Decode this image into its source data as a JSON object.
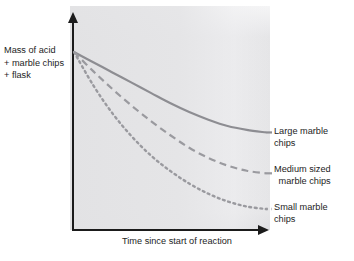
{
  "chart_data": {
    "type": "line",
    "title": "",
    "xlabel": "Time since start of reaction",
    "ylabel": "Mass of acid\n+ marble chips\n+ flask",
    "grid": false,
    "legend_position": "right-inline",
    "xlim": [
      0,
      100
    ],
    "ylim": [
      0,
      100
    ],
    "axis_ticks": {
      "x": [],
      "y": []
    },
    "x": [
      0,
      10,
      20,
      30,
      40,
      50,
      60,
      70,
      80,
      90,
      100
    ],
    "series": [
      {
        "name": "Large marble chips",
        "label": "Large marble\nchips",
        "style": "solid",
        "color": "#8d8d92",
        "values": [
          100,
          96,
          92,
          88,
          84,
          80,
          76.5,
          73.5,
          71,
          69.5,
          68.5
        ]
      },
      {
        "name": "Medium sized marble chips",
        "label": "Medium sized\nmarble chips",
        "style": "dashed",
        "color": "#9a9a9f",
        "values": [
          100,
          92.5,
          85.5,
          79,
          73,
          67.5,
          62.5,
          58.5,
          55.5,
          53.5,
          52.5
        ]
      },
      {
        "name": "Small marble chips",
        "label": "Small marble\nchips",
        "style": "dotted",
        "color": "#9a9a9f",
        "values": [
          100,
          87,
          76,
          67,
          59.5,
          53.5,
          48.5,
          44.5,
          41.5,
          39.5,
          38.5
        ]
      }
    ],
    "annotations": [
      "Mass decreases over time as carbon dioxide gas escapes",
      "Smaller chips have larger surface area so react fastest"
    ],
    "colors": {
      "axis": "#1b1b1b",
      "panel_background": "#e4e4e6",
      "text": "#1d1d1d",
      "curve_large": "#8d8d92",
      "curve_medium": "#9a9a9f",
      "curve_small": "#9a9a9f"
    }
  },
  "labels": {
    "y_axis_title": "Mass of acid\n+ marble chips\n+ flask",
    "x_axis_title": "Time since start of reaction",
    "large": "Large marble\nchips",
    "medium": "Medium sized\nmarble chips",
    "small": "Small marble\nchips"
  }
}
